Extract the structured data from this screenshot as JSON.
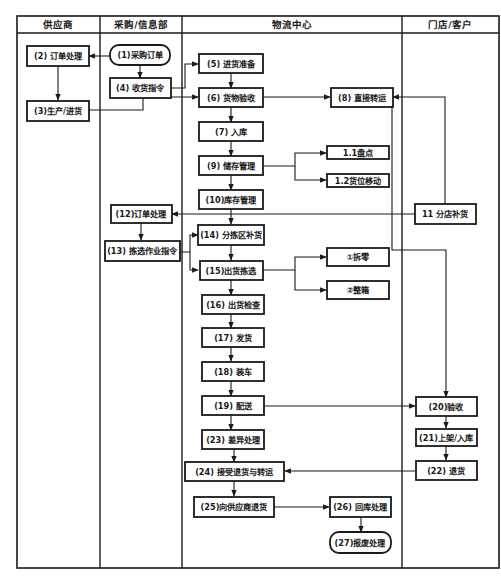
{
  "diagram": {
    "type": "swimlane-flowchart",
    "lanes": [
      {
        "id": "supplier",
        "label": "供应商"
      },
      {
        "id": "purchasing",
        "label": "采购/信息部"
      },
      {
        "id": "logistics",
        "label": "物流中心"
      },
      {
        "id": "store",
        "label": "门店/客户"
      }
    ],
    "nodes": {
      "n1": {
        "label": "(1)采购订单",
        "lane": "purchasing",
        "shape": "rounded"
      },
      "n2": {
        "label": "(2) 订单处理",
        "lane": "supplier"
      },
      "n3": {
        "label": "(3)生产/进货",
        "lane": "supplier"
      },
      "n4": {
        "label": "(4) 收货指令",
        "lane": "purchasing"
      },
      "n5": {
        "label": "(5) 进货准备",
        "lane": "logistics"
      },
      "n6": {
        "label": "(6) 货物验收",
        "lane": "logistics"
      },
      "n7": {
        "label": "(7) 入库",
        "lane": "logistics"
      },
      "n8": {
        "label": "(8) 直接转运",
        "lane": "logistics"
      },
      "n9": {
        "label": "(9) 储存管理",
        "lane": "logistics"
      },
      "n9a": {
        "label": "1.1盘点",
        "lane": "logistics"
      },
      "n9b": {
        "label": "1.2货位移动",
        "lane": "logistics"
      },
      "n10": {
        "label": "(10)库存管理",
        "lane": "logistics"
      },
      "n11": {
        "label": "11 分店补货",
        "lane": "store"
      },
      "n12": {
        "label": "(12)订单处理",
        "lane": "purchasing"
      },
      "n13": {
        "label": "(13) 拣选作业指令",
        "lane": "purchasing"
      },
      "n14": {
        "label": "(14) 分拣区补货",
        "lane": "logistics"
      },
      "n15": {
        "label": "(15)出货拣选",
        "lane": "logistics"
      },
      "n15a": {
        "label": "①拆零",
        "lane": "logistics"
      },
      "n15b": {
        "label": "②整箱",
        "lane": "logistics"
      },
      "n16": {
        "label": "(16) 出货检查",
        "lane": "logistics"
      },
      "n17": {
        "label": "(17) 发货",
        "lane": "logistics"
      },
      "n18": {
        "label": "(18) 装车",
        "lane": "logistics"
      },
      "n19": {
        "label": "(19) 配送",
        "lane": "logistics"
      },
      "n20": {
        "label": "(20)验收",
        "lane": "store"
      },
      "n21": {
        "label": "(21)上架/入库",
        "lane": "store"
      },
      "n22": {
        "label": "(22) 退货",
        "lane": "store"
      },
      "n23": {
        "label": "(23) 差异处理",
        "lane": "logistics"
      },
      "n24": {
        "label": "(24) 接受退货与转运",
        "lane": "logistics"
      },
      "n25": {
        "label": "(25)向供应商退货",
        "lane": "logistics"
      },
      "n26": {
        "label": "(26) 回库处理",
        "lane": "logistics"
      },
      "n27": {
        "label": "(27)报废处理",
        "lane": "logistics",
        "shape": "rounded"
      }
    },
    "edges": [
      [
        "n1",
        "n2"
      ],
      [
        "n1",
        "n4"
      ],
      [
        "n2",
        "n3"
      ],
      [
        "n3",
        "n6"
      ],
      [
        "n4",
        "n5"
      ],
      [
        "n4",
        "n6"
      ],
      [
        "n5",
        "n6"
      ],
      [
        "n6",
        "n7"
      ],
      [
        "n6",
        "n8"
      ],
      [
        "n7",
        "n9"
      ],
      [
        "n9",
        "n9a"
      ],
      [
        "n9",
        "n9b"
      ],
      [
        "n9",
        "n10"
      ],
      [
        "n11",
        "n8"
      ],
      [
        "n11",
        "n12"
      ],
      [
        "n10",
        "n14"
      ],
      [
        "n12",
        "n13"
      ],
      [
        "n13",
        "n14"
      ],
      [
        "n13",
        "n15"
      ],
      [
        "n14",
        "n15"
      ],
      [
        "n15",
        "n15a"
      ],
      [
        "n15",
        "n15b"
      ],
      [
        "n15",
        "n16"
      ],
      [
        "n16",
        "n17"
      ],
      [
        "n17",
        "n18"
      ],
      [
        "n18",
        "n19"
      ],
      [
        "n19",
        "n20"
      ],
      [
        "n19",
        "n23"
      ],
      [
        "n8",
        "n20"
      ],
      [
        "n20",
        "n21"
      ],
      [
        "n21",
        "n22"
      ],
      [
        "n22",
        "n24"
      ],
      [
        "n23",
        "n24"
      ],
      [
        "n24",
        "n25"
      ],
      [
        "n25",
        "n26"
      ],
      [
        "n26",
        "n27"
      ]
    ]
  }
}
